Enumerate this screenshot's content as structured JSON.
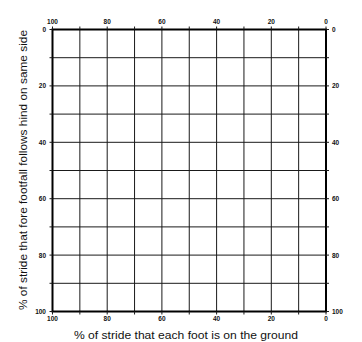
{
  "chart_data": {
    "type": "table",
    "title": "",
    "xlabel": "% of stride that each foot is on the ground",
    "ylabel": "% of stride that fore footfall follows hind on same side",
    "x_ticks_top": [
      "100",
      "80",
      "60",
      "40",
      "20",
      "0"
    ],
    "x_ticks_bottom": [
      "100",
      "80",
      "60",
      "40",
      "20",
      "0"
    ],
    "y_ticks_left": [
      "0",
      "20",
      "40",
      "60",
      "80",
      "100"
    ],
    "y_ticks_right": [
      "0",
      "20",
      "40",
      "60",
      "80",
      "100"
    ],
    "xlim": [
      100,
      0
    ],
    "ylim": [
      0,
      100
    ],
    "x_reversed": true,
    "y_reversed": true,
    "grid": true,
    "grid_divisions": {
      "x": 10,
      "y": 10
    },
    "grid_step": 10,
    "series": [],
    "legend": null
  },
  "colors": {
    "grid": "#1a1a1a",
    "frame": "#000000",
    "background": "#ffffff"
  }
}
